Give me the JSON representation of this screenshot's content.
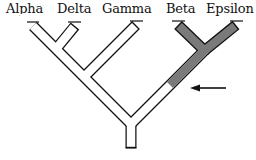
{
  "diagram": {
    "type": "cladogram",
    "taxa": [
      {
        "label": "Alpha",
        "x": 6
      },
      {
        "label": "Delta",
        "x": 57
      },
      {
        "label": "Gamma",
        "x": 102
      },
      {
        "label": "Beta",
        "x": 166
      },
      {
        "label": "Epsilon",
        "x": 206
      }
    ],
    "highlighted_clade": [
      "Beta",
      "Epsilon"
    ],
    "colors": {
      "outline": "#111111",
      "fill": "#ffffff",
      "highlight": "#7a7a7a",
      "arrow": "#111111"
    },
    "arrow": {
      "points_to": "stem of Beta+Epsilon clade (highlighted branch start)"
    }
  }
}
